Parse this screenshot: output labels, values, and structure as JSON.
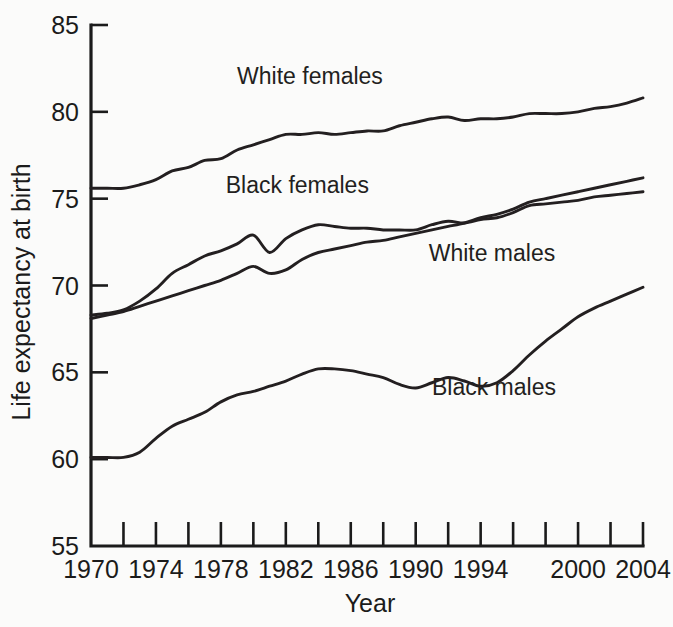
{
  "chart_data": {
    "type": "line",
    "title": "",
    "xlabel": "Year",
    "ylabel": "Life expectancy at birth",
    "xlim": [
      1970,
      2004
    ],
    "ylim": [
      55,
      85
    ],
    "grid": false,
    "legend_position": "inline-labels",
    "y_ticks": [
      55,
      60,
      65,
      70,
      75,
      80,
      85
    ],
    "y_tick_labels": [
      "55",
      "60",
      "65",
      "70",
      "75",
      "80",
      "85"
    ],
    "x_ticks": [
      1970,
      1972,
      1974,
      1976,
      1978,
      1980,
      1982,
      1984,
      1986,
      1988,
      1990,
      1992,
      1994,
      1996,
      1998,
      2000,
      2002,
      2004
    ],
    "x_tick_labels": [
      {
        "year": 1970,
        "label": "1970"
      },
      {
        "year": 1974,
        "label": "1974"
      },
      {
        "year": 1978,
        "label": "1978"
      },
      {
        "year": 1982,
        "label": "1982"
      },
      {
        "year": 1986,
        "label": "1986"
      },
      {
        "year": 1990,
        "label": "1990"
      },
      {
        "year": 1994,
        "label": "1994"
      },
      {
        "year": 2000,
        "label": "2000"
      },
      {
        "year": 2004,
        "label": "2004"
      }
    ],
    "x": [
      1970,
      1971,
      1972,
      1973,
      1974,
      1975,
      1976,
      1977,
      1978,
      1979,
      1980,
      1981,
      1982,
      1983,
      1984,
      1985,
      1986,
      1987,
      1988,
      1989,
      1990,
      1991,
      1992,
      1993,
      1994,
      1995,
      1996,
      1997,
      1998,
      1999,
      2000,
      2001,
      2002,
      2003,
      2004
    ],
    "series": [
      {
        "name": "White females",
        "color": "#231f20",
        "label_x": 1979.0,
        "label_y": 81.6,
        "values": [
          75.6,
          75.6,
          75.6,
          75.8,
          76.1,
          76.6,
          76.8,
          77.2,
          77.3,
          77.8,
          78.1,
          78.4,
          78.7,
          78.7,
          78.8,
          78.7,
          78.8,
          78.9,
          78.9,
          79.2,
          79.4,
          79.6,
          79.7,
          79.5,
          79.6,
          79.6,
          79.7,
          79.9,
          79.9,
          79.9,
          80.0,
          80.2,
          80.3,
          80.5,
          80.8
        ]
      },
      {
        "name": "Black females",
        "color": "#231f20",
        "label_x": 1978.3,
        "label_y": 75.3,
        "values": [
          68.3,
          68.4,
          68.6,
          69.1,
          69.8,
          70.7,
          71.2,
          71.7,
          72.0,
          72.4,
          72.9,
          71.9,
          72.7,
          73.2,
          73.5,
          73.4,
          73.3,
          73.3,
          73.2,
          73.2,
          73.2,
          73.5,
          73.7,
          73.6,
          73.8,
          73.9,
          74.2,
          74.6,
          74.7,
          74.8,
          74.9,
          75.1,
          75.2,
          75.3,
          75.4
        ]
      },
      {
        "name": "White males",
        "color": "#231f20",
        "label_x": 1990.8,
        "label_y": 71.4,
        "values": [
          68.1,
          68.3,
          68.5,
          68.8,
          69.1,
          69.4,
          69.7,
          70.0,
          70.3,
          70.7,
          71.1,
          70.7,
          70.9,
          71.5,
          71.9,
          72.1,
          72.3,
          72.5,
          72.6,
          72.8,
          73.0,
          73.2,
          73.4,
          73.6,
          73.9,
          74.1,
          74.4,
          74.8,
          75.0,
          75.2,
          75.4,
          75.6,
          75.8,
          76.0,
          76.2
        ]
      },
      {
        "name": "Black males",
        "color": "#231f20",
        "label_x": 1991.0,
        "label_y": 63.7,
        "values": [
          60.1,
          60.1,
          60.1,
          60.4,
          61.2,
          61.9,
          62.3,
          62.7,
          63.3,
          63.7,
          63.9,
          64.2,
          64.5,
          64.9,
          65.2,
          65.2,
          65.1,
          64.9,
          64.7,
          64.3,
          64.1,
          64.4,
          64.7,
          64.5,
          64.2,
          64.4,
          65.1,
          66.0,
          66.8,
          67.5,
          68.2,
          68.7,
          69.1,
          69.5,
          69.9
        ]
      }
    ]
  }
}
